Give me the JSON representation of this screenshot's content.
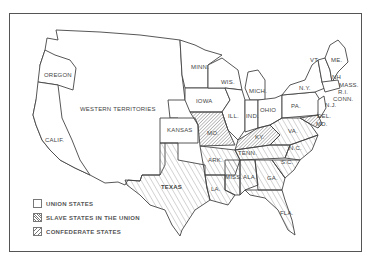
{
  "map": {
    "title": "",
    "colors": {
      "border": "#555555",
      "line": "#444444",
      "hatch": "#777777",
      "background": "#ffffff"
    },
    "regions": {
      "oregon": "OREGON",
      "calif": "CALIF.",
      "western_territories": "WESTERN TERRITORIES",
      "kansas": "KANSAS",
      "texas": "TEXAS",
      "minn": "MINN.",
      "iowa": "IOWA",
      "wis": "WIS.",
      "mich": "MICH.",
      "ill": "ILL.",
      "ind": "IND.",
      "ohio": "OHIO",
      "pa": "PA.",
      "ny": "N.Y.",
      "vt": "VT.",
      "me": "ME.",
      "nh": "NH",
      "mass": "MASS.",
      "ri": "R.I.",
      "conn": "CONN.",
      "nj": "N.J.",
      "del": "DEL.",
      "md": "MD.",
      "mo": "MO.",
      "ky": "KY.",
      "va": "VA.",
      "nc": "N.C.",
      "sc": "S.C.",
      "tenn": "TENN.",
      "ark": "ARK.",
      "la": "LA.",
      "miss": "MISS.",
      "ala": "ALA.",
      "ga": "GA.",
      "fla": "FLA."
    },
    "legend": [
      {
        "key": "union",
        "label": "UNION STATES"
      },
      {
        "key": "slave",
        "label": "SLAVE STATES IN THE UNION"
      },
      {
        "key": "confederate",
        "label": "CONFEDERATE STATES"
      }
    ]
  }
}
